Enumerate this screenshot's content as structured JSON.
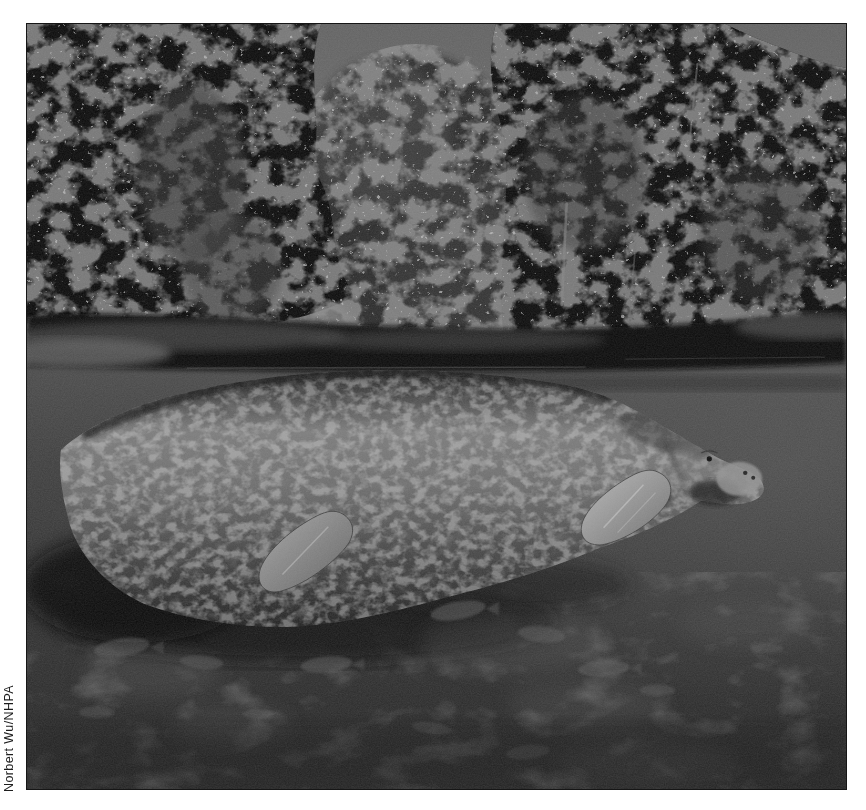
{
  "photo": {
    "credit": "Norbert Wu/NHPA",
    "alt": "Black-and-white photograph of a manatee floating just beneath the surface of a dark river. Trees and gray sky line the bank above the waterline; the manatee's pale flippers hang down and faint fish swim in the murky water below.",
    "colors": {
      "page_background": "#ffffff",
      "sky": "#6d6d6d",
      "trees": "#0e0e0e",
      "water_surface": "#4f4f4f",
      "water_deep": "#2a2a2a",
      "manatee_highlight": "#8f8f8f",
      "flipper_highlight": "#b2b2b2",
      "credit_text": "#1d1d1d"
    }
  }
}
